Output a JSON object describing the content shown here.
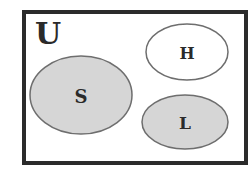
{
  "diagram": {
    "type": "venn",
    "universe": {
      "label": "U",
      "frame_color": "#2b2b2b",
      "fill": "#ffffff"
    },
    "sets": [
      {
        "label": "S",
        "shaded": true,
        "fill": "#d6d6d6",
        "stroke": "#6e6e6e",
        "cx": 81,
        "cy": 95,
        "rx": 51,
        "ry": 39
      },
      {
        "label": "H",
        "shaded": false,
        "fill": "#ffffff",
        "stroke": "#6e6e6e",
        "cx": 187,
        "cy": 52,
        "rx": 41,
        "ry": 28
      },
      {
        "label": "L",
        "shaded": true,
        "fill": "#d6d6d6",
        "stroke": "#6e6e6e",
        "cx": 185,
        "cy": 122,
        "rx": 43,
        "ry": 27
      }
    ]
  }
}
